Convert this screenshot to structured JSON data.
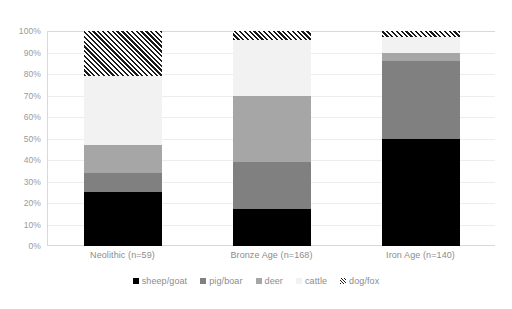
{
  "chart_data": {
    "type": "bar",
    "subtype": "stacked-percentage",
    "title": "",
    "xlabel": "",
    "ylabel": "",
    "ylim": [
      0,
      100
    ],
    "grid": true,
    "legend_position": "bottom",
    "categories": [
      "Neolithic (n=59)",
      "Bronze Age (n=168)",
      "Iron Age (n=140)"
    ],
    "y_ticks": [
      "0%",
      "10%",
      "20%",
      "30%",
      "40%",
      "50%",
      "60%",
      "70%",
      "80%",
      "90%",
      "100%"
    ],
    "y_tick_values": [
      0,
      10,
      20,
      30,
      40,
      50,
      60,
      70,
      80,
      90,
      100
    ],
    "series": [
      {
        "name": "sheep/goat",
        "color": "#000000",
        "pattern": "solid",
        "values": [
          25,
          17,
          50
        ]
      },
      {
        "name": "pig/boar",
        "color": "#808080",
        "pattern": "solid",
        "values": [
          9,
          22,
          36
        ]
      },
      {
        "name": "deer",
        "color": "#a6a6a6",
        "pattern": "solid",
        "values": [
          13,
          31,
          4
        ]
      },
      {
        "name": "cattle",
        "color": "#f2f2f2",
        "pattern": "solid",
        "values": [
          32,
          26,
          7
        ]
      },
      {
        "name": "dog/fox",
        "color": "#1a1a1a",
        "pattern": "diagonal-hatch",
        "values": [
          21,
          4,
          3
        ]
      }
    ]
  },
  "caption": ""
}
